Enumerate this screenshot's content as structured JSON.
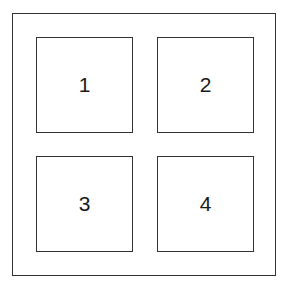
{
  "diagram": {
    "boxes": [
      {
        "label": "1"
      },
      {
        "label": "2"
      },
      {
        "label": "3"
      },
      {
        "label": "4"
      }
    ]
  }
}
